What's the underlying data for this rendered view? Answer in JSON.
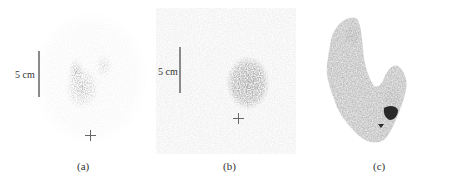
{
  "figure": {
    "panels": [
      {
        "id": "a",
        "caption": "(a)",
        "scale_label": "5 cm",
        "description": "Scintigraphy image with faint uptake and small V-shaped hot region; cross marker below"
      },
      {
        "id": "b",
        "caption": "(b)",
        "scale_label": "5 cm",
        "description": "Scintigraphy image with diffuse gray background and dark oval hot nodule; cross marker below"
      },
      {
        "id": "c",
        "caption": "(c)",
        "description": "Thyroid scintigram showing two lobes with a small dark focal spot near isthmus"
      }
    ],
    "colors": {
      "background": "#ffffff",
      "uptake_dark": "#3a3a3a",
      "uptake_mid": "#7a7a7a",
      "scale_bar": "#8a8a8a"
    }
  }
}
